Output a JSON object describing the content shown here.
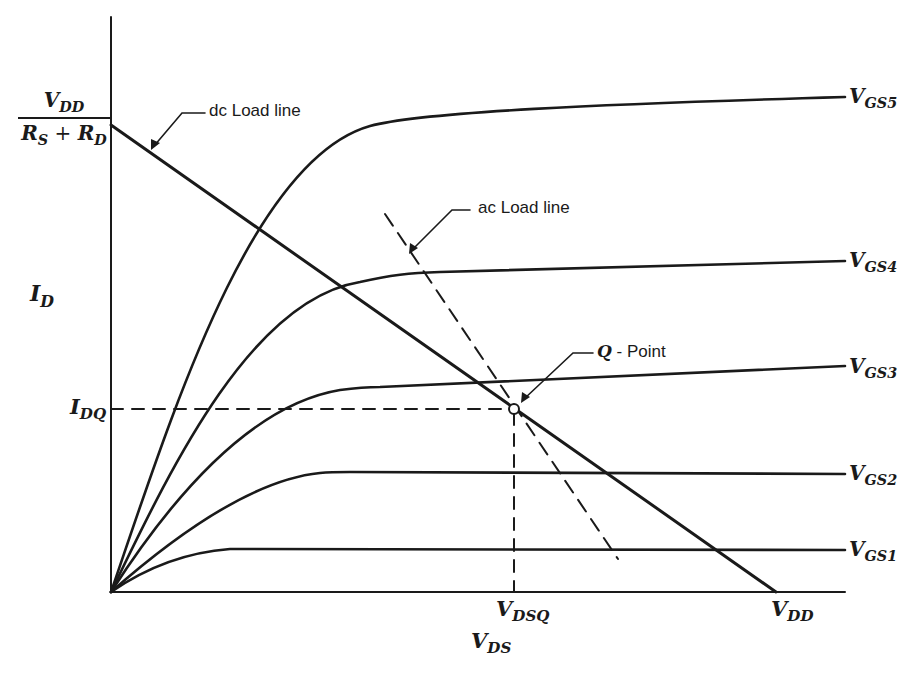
{
  "diagram": {
    "axes": {
      "y_label": {
        "main": "I",
        "sub": "D"
      },
      "x_label": {
        "main": "V",
        "sub": "DS"
      }
    },
    "intercepts": {
      "y_intercept": {
        "numerator": {
          "main": "V",
          "sub": "DD"
        },
        "denominator": {
          "a": "R",
          "a_sub": "S",
          "op": " + ",
          "b": "R",
          "b_sub": "D"
        }
      },
      "x_intercept": {
        "main": "V",
        "sub": "DD"
      },
      "idq": {
        "main": "I",
        "sub": "DQ"
      },
      "vdsq": {
        "main": "V",
        "sub": "DSQ"
      }
    },
    "curves": [
      {
        "label_main": "V",
        "label_sub": "GS5"
      },
      {
        "label_main": "V",
        "label_sub": "GS4"
      },
      {
        "label_main": "V",
        "label_sub": "GS3"
      },
      {
        "label_main": "V",
        "label_sub": "GS2"
      },
      {
        "label_main": "V",
        "label_sub": "GS1"
      }
    ],
    "annotations": {
      "dc_load_line": "dc Load line",
      "ac_load_line": "ac Load line",
      "q_point_q": "Q",
      "q_point_rest": " - Point"
    },
    "colors": {
      "ink": "#1a1a1a",
      "background": "#ffffff"
    }
  }
}
